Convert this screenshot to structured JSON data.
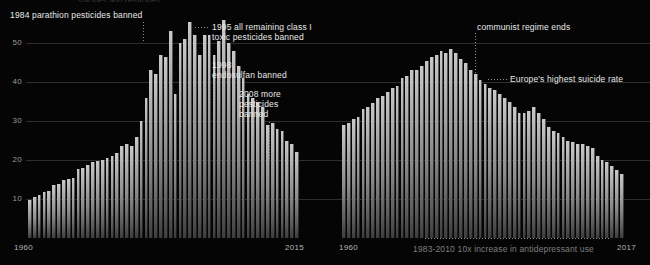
{
  "figure": {
    "background": "#050505",
    "bar_color": "#b0b0b0",
    "grid_color": "#2e2e2e",
    "text_color": "#e8e8e8",
    "muted_text_color": "#7d7d7d",
    "clipped_top_text": "suicides and pesticides"
  },
  "panels": [
    {
      "id": "left",
      "name": "sri-lanka-suicide-rate",
      "yticks": [
        "50",
        "40",
        "30",
        "20",
        "10"
      ],
      "xticks": {
        "start": "1960",
        "end": "2015"
      },
      "annotations": [
        {
          "name": "annotation-1984-parathion",
          "text": "1984 parathion pesticides banned"
        },
        {
          "name": "annotation-1995-class-i",
          "text": "1995 all remaining class I\ntoxic pesticides banned"
        },
        {
          "name": "annotation-1998-endosulfan",
          "text": "1998\nendosulfan banned"
        },
        {
          "name": "annotation-2008-more-pesticides",
          "text": "2008 more\npesticides\nbanned"
        }
      ]
    },
    {
      "id": "right",
      "name": "hungary-suicide-rate",
      "yticks": [],
      "xticks": {
        "start": "1960",
        "end": "2017"
      },
      "annotations": [
        {
          "name": "annotation-communist-regime-ends",
          "text": "communist regime ends"
        },
        {
          "name": "annotation-europes-highest-suicide-rate",
          "text": "Europe's highest suicide rate"
        },
        {
          "name": "annotation-antidepressant-use",
          "text": "1983-2010 10x increase in antidepressant use"
        }
      ]
    }
  ],
  "chart_data": [
    {
      "type": "bar",
      "name": "left-chart",
      "title": "",
      "xlabel": "",
      "ylabel": "",
      "ylim": [
        0,
        58
      ],
      "grid": true,
      "yticks": [
        10,
        20,
        30,
        40,
        50
      ],
      "xtick_labels": [
        "1960",
        "2015"
      ],
      "x": [
        1960,
        1961,
        1962,
        1963,
        1964,
        1965,
        1966,
        1967,
        1968,
        1969,
        1970,
        1971,
        1972,
        1973,
        1974,
        1975,
        1976,
        1977,
        1978,
        1979,
        1980,
        1981,
        1982,
        1983,
        1984,
        1985,
        1986,
        1987,
        1988,
        1989,
        1990,
        1991,
        1992,
        1993,
        1994,
        1995,
        1996,
        1997,
        1998,
        1999,
        2000,
        2001,
        2002,
        2003,
        2004,
        2005,
        2006,
        2007,
        2008,
        2009,
        2010,
        2011,
        2012,
        2013,
        2014,
        2015
      ],
      "values": [
        9.8,
        10.5,
        11.0,
        11.8,
        12.0,
        13.5,
        13.8,
        15.0,
        15.2,
        15.5,
        17.6,
        18.0,
        18.6,
        19.5,
        19.8,
        20.0,
        20.5,
        21.0,
        21.8,
        23.5,
        24.0,
        23.6,
        26.0,
        30.0,
        36.0,
        43.0,
        42.0,
        47.0,
        46.5,
        53.0,
        37.0,
        50.0,
        51.0,
        55.5,
        52.0,
        47.0,
        52.0,
        52.0,
        47.0,
        50.5,
        56.0,
        50.0,
        48.0,
        44.0,
        41.0,
        37.0,
        36.0,
        35.0,
        33.5,
        29.0,
        29.5,
        28.0,
        27.5,
        25.0,
        24.0,
        22.0
      ],
      "annotations": [
        {
          "label": "1984 parathion pesticides banned",
          "x": 1984
        },
        {
          "label": "1995 all remaining class I toxic pesticides banned",
          "x": 1995
        },
        {
          "label": "1998 endosulfan banned",
          "x": 1998
        },
        {
          "label": "2008 more pesticides banned",
          "x": 2008
        }
      ]
    },
    {
      "type": "bar",
      "name": "right-chart",
      "title": "",
      "xlabel": "",
      "ylabel": "",
      "ylim": [
        0,
        58
      ],
      "grid": true,
      "yticks": [
        10,
        20,
        30,
        40,
        50
      ],
      "xtick_labels": [
        "1960",
        "2017"
      ],
      "x": [
        1960,
        1961,
        1962,
        1963,
        1964,
        1965,
        1966,
        1967,
        1968,
        1969,
        1970,
        1971,
        1972,
        1973,
        1974,
        1975,
        1976,
        1977,
        1978,
        1979,
        1980,
        1981,
        1982,
        1983,
        1984,
        1985,
        1986,
        1987,
        1988,
        1989,
        1990,
        1991,
        1992,
        1993,
        1994,
        1995,
        1996,
        1997,
        1998,
        1999,
        2000,
        2001,
        2002,
        2003,
        2004,
        2005,
        2006,
        2007,
        2008,
        2009,
        2010,
        2011,
        2012,
        2013,
        2014,
        2015,
        2016,
        2017
      ],
      "values": [
        29.0,
        29.5,
        30.5,
        31.0,
        33.0,
        33.5,
        34.5,
        36.0,
        36.5,
        37.5,
        38.5,
        39.0,
        41.0,
        41.5,
        43.0,
        43.0,
        44.0,
        45.5,
        46.5,
        47.0,
        48.0,
        47.5,
        48.5,
        47.5,
        46.0,
        45.0,
        43.0,
        42.0,
        40.5,
        39.5,
        38.5,
        38.0,
        37.0,
        36.0,
        35.0,
        33.5,
        32.0,
        32.0,
        32.5,
        33.5,
        32.0,
        30.5,
        28.5,
        27.5,
        27.0,
        26.0,
        25.0,
        24.5,
        24.0,
        24.0,
        23.5,
        23.0,
        21.0,
        20.0,
        19.5,
        18.5,
        17.5,
        16.5
      ],
      "annotations": [
        {
          "label": "communist regime ends",
          "x": 1989
        },
        {
          "label": "Europe's highest suicide rate",
          "x": 1984
        },
        {
          "label": "1983-2010 10x increase in antidepressant use",
          "x": 1996
        }
      ]
    }
  ]
}
